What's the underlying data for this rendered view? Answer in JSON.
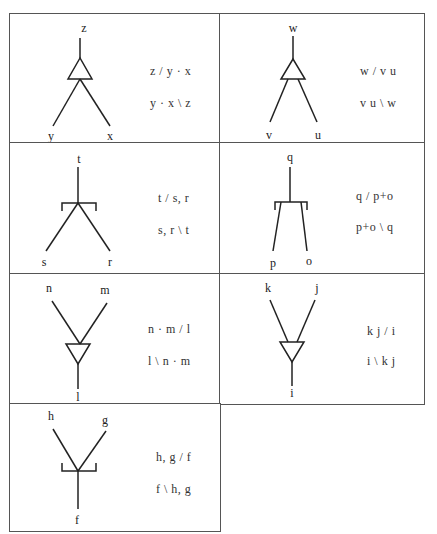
{
  "cells": [
    {
      "id": "c1",
      "labels": {
        "top": "z",
        "left": "y",
        "right": "x"
      },
      "formulas": [
        "z / y · x",
        "y · x \\ z"
      ]
    },
    {
      "id": "c2",
      "labels": {
        "top": "w",
        "left": "v",
        "right": "u"
      },
      "formulas": [
        "w / v u",
        "v u \\ w"
      ]
    },
    {
      "id": "c3",
      "labels": {
        "top": "t",
        "left": "s",
        "right": "r"
      },
      "formulas": [
        "t / s, r",
        "s, r \\ t"
      ]
    },
    {
      "id": "c4",
      "labels": {
        "top": "q",
        "left": "p",
        "right": "o"
      },
      "formulas": [
        "q / p+o",
        "p+o \\ q"
      ]
    },
    {
      "id": "c5",
      "labels": {
        "left": "n",
        "right": "m",
        "bottom": "l"
      },
      "formulas": [
        "n · m / l",
        "l \\ n · m"
      ]
    },
    {
      "id": "c6",
      "labels": {
        "left": "k",
        "right": "j",
        "bottom": "i"
      },
      "formulas": [
        "k j / i",
        "i \\ k j"
      ]
    },
    {
      "id": "c7",
      "labels": {
        "left": "h",
        "right": "g",
        "bottom": "f"
      },
      "formulas": [
        "h, g / f",
        "f \\ h, g"
      ]
    }
  ]
}
